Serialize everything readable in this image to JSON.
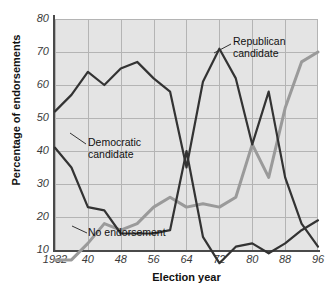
{
  "chart_data": {
    "type": "line",
    "title": "",
    "xlabel": "Election year",
    "ylabel": "Percentage of endorsements",
    "xlim": [
      1932,
      1996
    ],
    "ylim": [
      4,
      80
    ],
    "grid": true,
    "legend_position": "inline-annotations",
    "x": [
      1932,
      1936,
      1940,
      1944,
      1948,
      1952,
      1956,
      1960,
      1964,
      1968,
      1972,
      1976,
      1980,
      1984,
      1988,
      1992,
      1996
    ],
    "xticks": [
      1932,
      1940,
      1948,
      1956,
      1964,
      1972,
      1980,
      1988,
      1996
    ],
    "xticklabels": [
      "1932",
      "40",
      "48",
      "56",
      "64",
      "72",
      "80",
      "88",
      "96"
    ],
    "yticks": [
      10,
      20,
      30,
      40,
      50,
      60,
      70,
      80
    ],
    "yticklabels": [
      "10",
      "20",
      "30",
      "40",
      "50",
      "60",
      "70",
      "80"
    ],
    "series": [
      {
        "name": "Republican candidate",
        "color": "#333333",
        "values": [
          52,
          57,
          64,
          60,
          65,
          67,
          62,
          58,
          35,
          61,
          71,
          62,
          42,
          58,
          32,
          18,
          11
        ]
      },
      {
        "name": "Democratic candidate",
        "color": "#333333",
        "values": [
          41,
          35,
          23,
          22,
          15,
          15,
          15,
          16,
          40,
          14,
          6,
          11,
          12,
          9,
          12,
          16,
          19
        ]
      },
      {
        "name": "No endorsement",
        "color": "#9a9a9a",
        "values": [
          7,
          7,
          12,
          18,
          16,
          18,
          23,
          26,
          23,
          24,
          23,
          26,
          42,
          32,
          53,
          67,
          70
        ]
      }
    ],
    "annotations": [
      {
        "name": "Republican candidate",
        "line1": "Republican",
        "line2": "candidate"
      },
      {
        "name": "Democratic candidate",
        "line1": "Democratic",
        "line2": "candidate"
      },
      {
        "name": "No endorsement",
        "line1": "No endorsement",
        "line2": ""
      }
    ],
    "colors": {
      "plot_background": "#e4e4e4",
      "gridline": "#b4b4b4",
      "axis": "#4a4a4a",
      "dark_series": "#333333",
      "light_series": "#9a9a9a"
    }
  }
}
